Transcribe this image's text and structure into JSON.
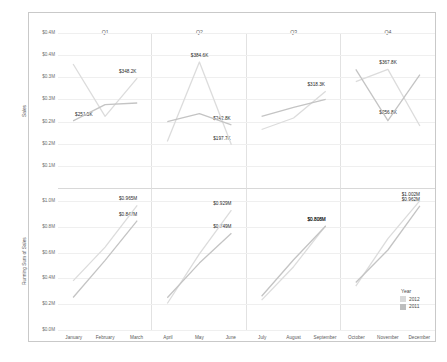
{
  "chart_data": {
    "type": "line",
    "title": "Quarterly panes",
    "xlabel": "",
    "legend": {
      "title": "Year",
      "position": "bottom-right",
      "entries": [
        {
          "label": "2012",
          "color": "#d9d9d9"
        },
        {
          "label": "2011",
          "color": "#bdbdbd"
        }
      ]
    },
    "columns": [
      {
        "header": "Q1",
        "months": [
          "January",
          "February",
          "March"
        ]
      },
      {
        "header": "Q2",
        "months": [
          "April",
          "May",
          "June"
        ]
      },
      {
        "header": "Q3",
        "months": [
          "July",
          "August",
          "September"
        ]
      },
      {
        "header": "Q4",
        "months": [
          "October",
          "November",
          "December"
        ]
      }
    ],
    "panes": [
      {
        "name": "sales-pane",
        "ylabel": "Sales",
        "ylim": [
          100000,
          450000
        ],
        "yticks": [
          "$0.4M",
          "$0.4M",
          "$0.3M",
          "$0.3M",
          "$0.2M",
          "$0.2M",
          "$0.1M"
        ],
        "ytick_values": [
          450000,
          400000,
          350000,
          300000,
          250000,
          200000,
          150000
        ],
        "series": [
          {
            "name": "2012",
            "color": "#dcdcdc",
            "values": [
              380000,
              262000,
              348200,
              205000,
              384600,
              197700,
              232000,
              258000,
              318300,
              340000,
              367800,
              240000
            ]
          },
          {
            "name": "2011",
            "color": "#c4c4c4",
            "values": [
              251500,
              288000,
              292000,
              250000,
              268000,
              242800,
              262000,
              282000,
              300000,
              368000,
              252000,
              356000
            ]
          }
        ],
        "labels": [
          {
            "text": "$348.2K",
            "month": "March",
            "value": 348200
          },
          {
            "text": "$251.5K",
            "month": "January",
            "value": 251500
          },
          {
            "text": "$384.6K",
            "month": "May",
            "value": 384600
          },
          {
            "text": "$242.8K",
            "month": "June",
            "value": 242800
          },
          {
            "text": "$197.7K",
            "month": "June",
            "value": 197700
          },
          {
            "text": "$318.3K",
            "month": "September",
            "value": 318300
          },
          {
            "text": "$367.8K",
            "month": "November",
            "value": 367800
          },
          {
            "text": "$256.8K",
            "month": "November",
            "value": 256800
          }
        ]
      },
      {
        "name": "running-sum-pane",
        "ylabel": "Running Sum of Sales",
        "ylim": [
          0,
          1100000
        ],
        "yticks": [
          "$1.0M",
          "$0.8M",
          "$0.6M",
          "$0.4M",
          "$0.2M",
          "$0.0M"
        ],
        "ytick_values": [
          1000000,
          800000,
          600000,
          400000,
          200000,
          0
        ],
        "series": [
          {
            "name": "2012",
            "color": "#dcdcdc",
            "values": [
              380000,
              642000,
              965000,
              205000,
              589600,
              929000,
              232000,
              490000,
              808300,
              340000,
              707800,
              1002000
            ]
          },
          {
            "name": "2011",
            "color": "#c4c4c4",
            "values": [
              251500,
              539500,
              847000,
              250000,
              518000,
              749000,
              262000,
              544000,
              806000,
              368000,
              620000,
              962000
            ]
          }
        ],
        "labels": [
          {
            "text": "$0.965M",
            "month": "March",
            "value": 965000
          },
          {
            "text": "$0.847M",
            "month": "March",
            "value": 847000
          },
          {
            "text": "$0.929M",
            "month": "June",
            "value": 929000
          },
          {
            "text": "$0.749M",
            "month": "June",
            "value": 749000
          },
          {
            "text": "$0.808M",
            "month": "September",
            "value": 808300
          },
          {
            "text": "$0.806M",
            "month": "September",
            "value": 806000
          },
          {
            "text": "$1.002M",
            "month": "December",
            "value": 1002000
          },
          {
            "text": "$0.962M",
            "month": "December",
            "value": 962000
          }
        ]
      }
    ]
  }
}
